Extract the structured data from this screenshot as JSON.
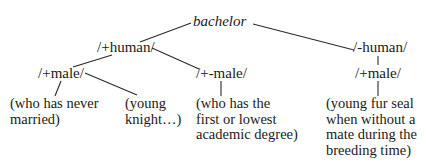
{
  "diagram": {
    "type": "semantic-feature-tree",
    "root": {
      "label": "bachelor",
      "style": "italic"
    },
    "nodes": {
      "human_plus": "/+human/",
      "human_minus": "/-human/",
      "male_plus_left": "/+male/",
      "male_plusminus": "/+-male/",
      "male_plus_right": "/+male/"
    },
    "leaves": {
      "never_married": "(who has never\nmarried)",
      "young_knight": "(young\nknight…)",
      "academic_degree": "(who has the\nfirst or lowest\nacademic degree)",
      "fur_seal": "(young fur seal\nwhen without a\nmate during the\nbreeding time)"
    },
    "edges": [
      [
        "bachelor",
        "/+human/"
      ],
      [
        "bachelor",
        "/-human/"
      ],
      [
        "/+human/",
        "/+male/ (left)"
      ],
      [
        "/+human/",
        "/+-male/"
      ],
      [
        "/-human/",
        "/+male/ (right)"
      ],
      [
        "/+male/ (left)",
        "(who has never married)"
      ],
      [
        "/+male/ (left)",
        "(young knight…)"
      ],
      [
        "/+-male/",
        "(who has the first or lowest academic degree)"
      ],
      [
        "/+male/ (right)",
        "(young fur seal when without a mate during the breeding time)"
      ]
    ]
  }
}
